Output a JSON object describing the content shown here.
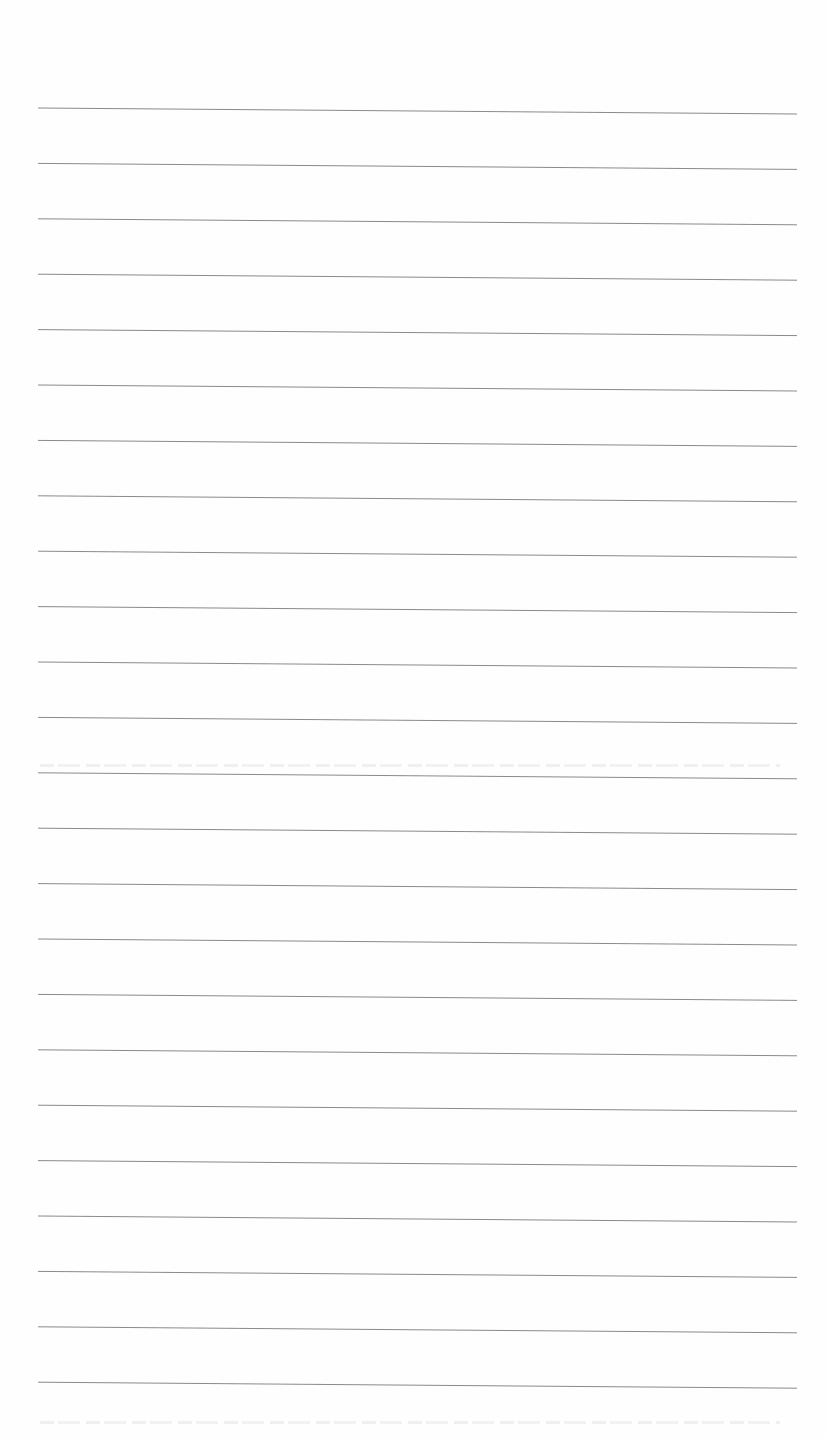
{
  "page": {
    "type": "lined-paper",
    "background_color": "#fefefe",
    "line_color": "#8a8a8a",
    "line_count": 24,
    "line_start_x": 38,
    "line_end_x": 797,
    "first_line_y": 108,
    "line_spacing": 55.4,
    "line_tilt_px": 6
  }
}
